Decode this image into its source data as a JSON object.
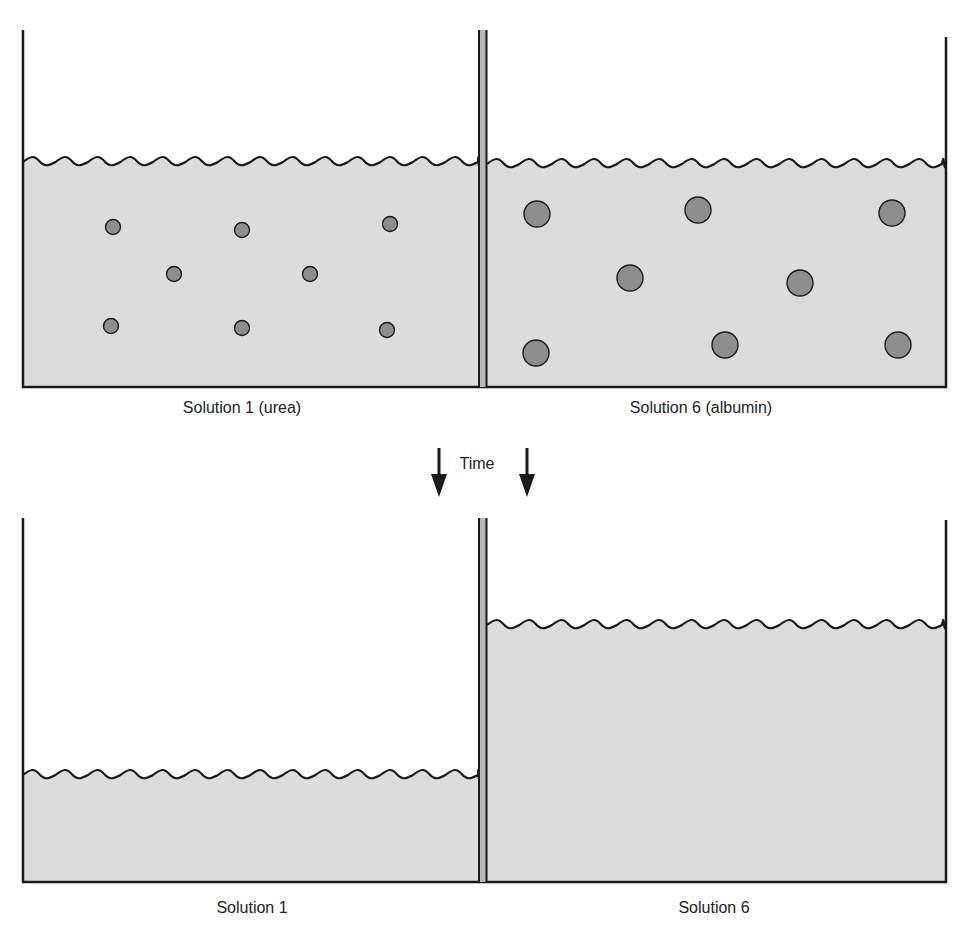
{
  "colors": {
    "solution_fill": "#dcdcdc",
    "line": "#1a1a1a",
    "membrane_fill": "#b8b8b8",
    "particle_fill": "#8e8e8e",
    "background": "#ffffff"
  },
  "top_panel": {
    "left_label": "Solution 1 (urea)",
    "right_label": "Solution 6 (albumin)",
    "left_level_y": 160,
    "right_level_y": 162,
    "left_particles": [
      {
        "x": 113,
        "y": 227,
        "r": 7.5
      },
      {
        "x": 242,
        "y": 230,
        "r": 7.5
      },
      {
        "x": 390,
        "y": 224,
        "r": 7.5
      },
      {
        "x": 174,
        "y": 274,
        "r": 7.5
      },
      {
        "x": 310,
        "y": 274,
        "r": 7.5
      },
      {
        "x": 111,
        "y": 326,
        "r": 7.5
      },
      {
        "x": 242,
        "y": 328,
        "r": 7.5
      },
      {
        "x": 387,
        "y": 330,
        "r": 7.5
      }
    ],
    "right_particles": [
      {
        "x": 537,
        "y": 214,
        "r": 13
      },
      {
        "x": 698,
        "y": 210,
        "r": 13
      },
      {
        "x": 892,
        "y": 213,
        "r": 13
      },
      {
        "x": 630,
        "y": 278,
        "r": 13
      },
      {
        "x": 800,
        "y": 283,
        "r": 13
      },
      {
        "x": 536,
        "y": 353,
        "r": 13
      },
      {
        "x": 725,
        "y": 345,
        "r": 13
      },
      {
        "x": 898,
        "y": 345,
        "r": 13
      }
    ]
  },
  "time_label": "Time",
  "bottom_panel": {
    "left_label": "Solution 1",
    "right_label": "Solution 6",
    "left_level_y": 775,
    "right_level_y": 625
  }
}
